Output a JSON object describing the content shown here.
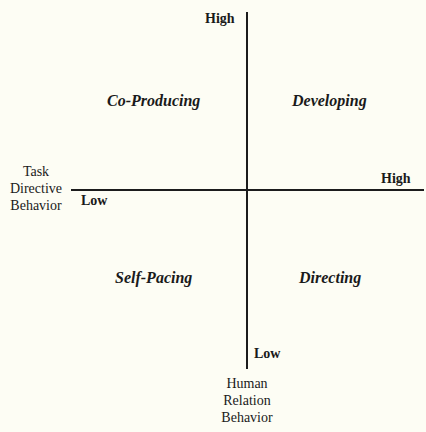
{
  "diagram": {
    "type": "quadrant",
    "horizontal_axis": {
      "title_lines": [
        "Task",
        "Directive",
        "Behavior"
      ],
      "low_label": "Low",
      "high_label": "High"
    },
    "vertical_axis": {
      "title_lines": [
        "Human",
        "Relation",
        "Behavior"
      ],
      "low_label": "Low",
      "high_label": "High"
    },
    "quadrants": {
      "top_left": "Co-Producing",
      "top_right": "Developing",
      "bottom_left": "Self-Pacing",
      "bottom_right": "Directing"
    },
    "colors": {
      "background": "#fdfdf4",
      "line": "#1c1c1c",
      "text": "#1a1a1a"
    }
  }
}
